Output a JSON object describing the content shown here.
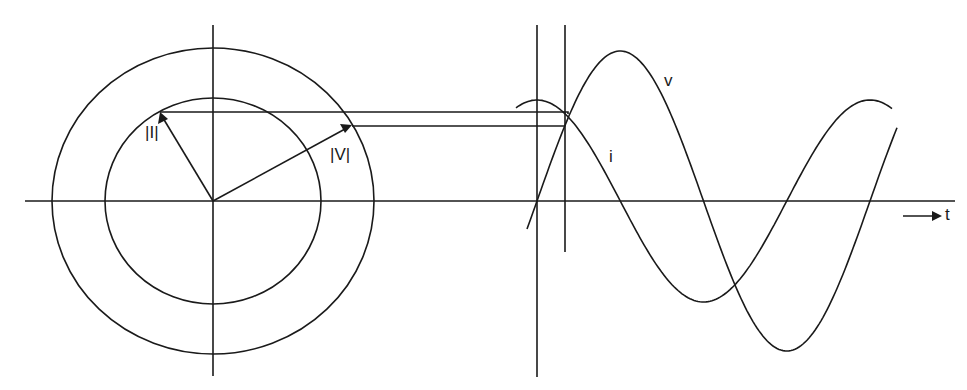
{
  "figure": {
    "caption_fragment": "Figure ...",
    "type": "phasor-to-waveform projection diagram"
  },
  "phasor": {
    "center": [
      213,
      201
    ],
    "outer_circle": {
      "rx": 161,
      "ry": 153,
      "represents": "|V| magnitude"
    },
    "inner_circle": {
      "rx": 108,
      "ry": 103,
      "represents": "|I| magnitude"
    },
    "current_phasor": {
      "label": "|I|",
      "tip": [
        160,
        112
      ]
    },
    "voltage_phasor": {
      "label": "|V|",
      "tip": [
        352,
        126
      ]
    }
  },
  "waveforms": {
    "time_axis_label": "t",
    "time_arrow": "→",
    "voltage": {
      "label": "v",
      "zero_up_x": 537,
      "period_px": 333,
      "amplitude_px": 150
    },
    "current": {
      "label": "i",
      "peak_x": 537,
      "period_px": 333,
      "amplitude_px": 101,
      "phase_lead": "90 deg"
    }
  },
  "colors": {
    "ink": "#1a1a1a",
    "background": "#ffffff"
  }
}
